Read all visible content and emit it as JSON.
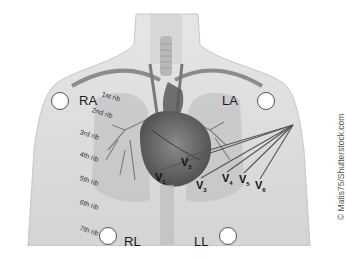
{
  "figure": {
    "limb_leads": [
      {
        "id": "RA",
        "label": "RA",
        "electrode_x": 60,
        "electrode_y": 101,
        "label_x": 79,
        "label_y": 94
      },
      {
        "id": "LA",
        "label": "LA",
        "electrode_x": 266,
        "electrode_y": 101,
        "label_x": 222,
        "label_y": 94
      },
      {
        "id": "RL",
        "label": "RL",
        "electrode_x": 108,
        "electrode_y": 236,
        "label_x": 124,
        "label_y": 235
      },
      {
        "id": "LL",
        "label": "LL",
        "electrode_x": 228,
        "electrode_y": 236,
        "label_x": 194,
        "label_y": 235
      }
    ],
    "ribs": [
      {
        "label": "1st rib",
        "x": 102,
        "y": 92
      },
      {
        "label": "2nd rib",
        "x": 92,
        "y": 108
      },
      {
        "label": "3rd rib",
        "x": 80,
        "y": 130
      },
      {
        "label": "4th rib",
        "x": 80,
        "y": 152
      },
      {
        "label": "5th rib",
        "x": 80,
        "y": 176
      },
      {
        "label": "6th rib",
        "x": 80,
        "y": 200
      },
      {
        "label": "7th rib",
        "x": 80,
        "y": 226
      }
    ],
    "precordial_leads": [
      {
        "base": "V",
        "sub": "1",
        "x": 155,
        "y": 172
      },
      {
        "base": "V",
        "sub": "2",
        "x": 181,
        "y": 158
      },
      {
        "base": "V",
        "sub": "3",
        "x": 196,
        "y": 180
      },
      {
        "base": "V",
        "sub": "4",
        "x": 222,
        "y": 173
      },
      {
        "base": "V",
        "sub": "5",
        "x": 239,
        "y": 174
      },
      {
        "base": "V",
        "sub": "6",
        "x": 255,
        "y": 180
      }
    ],
    "lead_wire_origin": {
      "x": 293,
      "y": 125
    },
    "watermark": "© Matis75/Shutterstock.com",
    "colors": {
      "background": "#ffffff",
      "body": "#d9d9d9",
      "heart": "#6a6a6a",
      "wires": "#555555",
      "text": "#1a1a1a"
    }
  }
}
